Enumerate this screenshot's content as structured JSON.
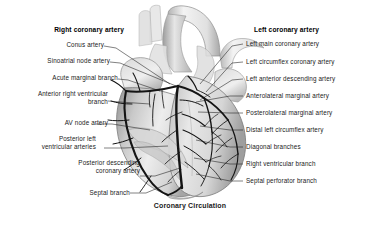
{
  "figure": {
    "title": "Coronary Circulation",
    "background_color": "#ffffff",
    "artery_color": "#111111",
    "heart_tone_light": "#f2f2f2",
    "heart_tone_mid": "#cfcfcf",
    "heart_tone_dark": "#9a9a9a"
  },
  "left_column": {
    "heading": "Right coronary artery",
    "labels": [
      {
        "text": "Conus artery"
      },
      {
        "text": "Sinoatrial node artery"
      },
      {
        "text": "Acute marginal branch"
      },
      {
        "text": "Anterior right ventricular\nbranch"
      },
      {
        "text": "AV node artery"
      },
      {
        "text": "Posterior left\nventricular arteries"
      },
      {
        "text": "Posterior descending\ncoronary artery"
      },
      {
        "text": "Septal branch"
      }
    ]
  },
  "right_column": {
    "heading": "Left coronary artery",
    "labels": [
      {
        "text": "Left main coronary artery"
      },
      {
        "text": "Left circumflex coronary artery"
      },
      {
        "text": "Left anterior descending artery"
      },
      {
        "text": "Anterolateral marginal artery"
      },
      {
        "text": "Posterolateral marginal artery"
      },
      {
        "text": "Distal left circumflex artery"
      },
      {
        "text": "Diagonal branches"
      },
      {
        "text": "Right ventricular branch"
      },
      {
        "text": "Septal perforator branch"
      }
    ]
  }
}
